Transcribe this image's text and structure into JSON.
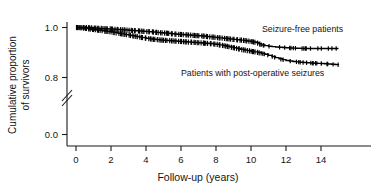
{
  "chart_data": {
    "type": "line",
    "subtype": "kaplan-meier-survival",
    "title": "",
    "xlabel": "Follow-up (years)",
    "ylabel": "Cumulative proportion of survivors",
    "ylabel_line1": "Cumulative proportion",
    "ylabel_line2": "of survivors",
    "xlim": [
      -0.4,
      15.4
    ],
    "ylim": [
      0.0,
      1.0
    ],
    "y_axis_break": true,
    "y_axis_break_between": [
      0.0,
      0.78
    ],
    "grid": false,
    "legend_position": "inline-annotations",
    "xticks": [
      0,
      2,
      4,
      6,
      8,
      10,
      12,
      14
    ],
    "xtick_labels": [
      "0",
      "2",
      "4",
      "6",
      "8",
      "10",
      "12",
      "14"
    ],
    "yticks": [
      1.0,
      0.8,
      0.0
    ],
    "ytick_labels": [
      "1.0",
      "0.8",
      "0.0"
    ],
    "annotations": [
      {
        "text": "Seizure-free patients",
        "x": 10.6,
        "y": 0.972,
        "series": "seizure-free"
      },
      {
        "text": "Patients with post-operative seizures",
        "x": 6.0,
        "y": 0.858,
        "series": "post-operative-seizures"
      }
    ],
    "series": [
      {
        "name": "Seizure-free patients",
        "color": "#000000",
        "style": "step-with-censor-ticks",
        "x": [
          0.0,
          0.5,
          1.0,
          1.5,
          2.0,
          2.4,
          2.8,
          3.2,
          3.6,
          4.0,
          4.4,
          4.8,
          5.2,
          5.6,
          6.0,
          6.4,
          6.8,
          7.2,
          7.6,
          8.0,
          8.4,
          8.8,
          9.2,
          9.6,
          10.0,
          10.3,
          10.6,
          11.0,
          11.4,
          11.8,
          12.2,
          12.6,
          13.0,
          13.5,
          14.0,
          14.5,
          15.0
        ],
        "y": [
          1.0,
          1.0,
          0.998,
          0.996,
          0.994,
          0.992,
          0.99,
          0.988,
          0.986,
          0.984,
          0.982,
          0.979,
          0.977,
          0.974,
          0.972,
          0.97,
          0.968,
          0.966,
          0.963,
          0.96,
          0.957,
          0.954,
          0.951,
          0.948,
          0.944,
          0.94,
          0.93,
          0.925,
          0.922,
          0.92,
          0.918,
          0.917,
          0.916,
          0.916,
          0.916,
          0.916,
          0.916
        ]
      },
      {
        "name": "Patients with post-operative seizures",
        "color": "#000000",
        "style": "step-with-censor-ticks",
        "x": [
          0.0,
          0.4,
          0.8,
          1.2,
          1.6,
          2.0,
          2.4,
          2.8,
          3.2,
          3.6,
          4.0,
          4.4,
          4.8,
          5.2,
          5.6,
          6.0,
          6.4,
          6.8,
          7.2,
          7.6,
          8.0,
          8.4,
          8.8,
          9.2,
          9.6,
          10.0,
          10.4,
          10.8,
          11.2,
          11.6,
          12.0,
          12.4,
          12.8,
          13.2,
          13.6,
          14.0,
          14.4,
          14.8,
          15.0
        ],
        "y": [
          1.0,
          0.998,
          0.994,
          0.99,
          0.986,
          0.982,
          0.977,
          0.972,
          0.967,
          0.962,
          0.957,
          0.953,
          0.95,
          0.948,
          0.946,
          0.944,
          0.942,
          0.94,
          0.938,
          0.936,
          0.933,
          0.928,
          0.922,
          0.916,
          0.91,
          0.905,
          0.9,
          0.893,
          0.884,
          0.875,
          0.868,
          0.864,
          0.861,
          0.859,
          0.857,
          0.856,
          0.854,
          0.852,
          0.851
        ]
      }
    ]
  }
}
